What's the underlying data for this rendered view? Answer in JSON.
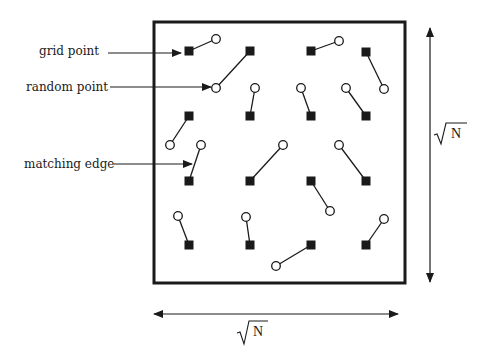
{
  "labels": {
    "grid_point": "grid point",
    "random_point": "random point",
    "matching_edge": "matching edge",
    "side_length_vertical": "N",
    "side_length_horizontal": "N"
  },
  "colors": {
    "ink": "#1a1a1a",
    "background": "#ffffff"
  },
  "box": {
    "x": 154,
    "y": 22,
    "width": 251,
    "height": 261
  },
  "grid_points": [
    [
      189,
      51
    ],
    [
      250,
      51
    ],
    [
      311,
      51
    ],
    [
      366,
      52
    ],
    [
      189,
      116
    ],
    [
      250,
      116
    ],
    [
      311,
      116
    ],
    [
      366,
      116
    ],
    [
      189,
      181
    ],
    [
      250,
      181
    ],
    [
      311,
      181
    ],
    [
      366,
      181
    ],
    [
      189,
      245
    ],
    [
      250,
      245
    ],
    [
      311,
      245
    ],
    [
      366,
      245
    ]
  ],
  "matching_edges": [
    {
      "grid": [
        189,
        51
      ],
      "random": [
        216,
        39
      ]
    },
    {
      "grid": [
        250,
        51
      ],
      "random": [
        216,
        88
      ]
    },
    {
      "grid": [
        311,
        51
      ],
      "random": [
        339,
        41
      ]
    },
    {
      "grid": [
        366,
        52
      ],
      "random": [
        384,
        89
      ]
    },
    {
      "grid": [
        189,
        116
      ],
      "random": [
        170,
        145
      ]
    },
    {
      "grid": [
        250,
        116
      ],
      "random": [
        255,
        88
      ]
    },
    {
      "grid": [
        311,
        116
      ],
      "random": [
        301,
        88
      ]
    },
    {
      "grid": [
        366,
        116
      ],
      "random": [
        346,
        88
      ]
    },
    {
      "grid": [
        189,
        181
      ],
      "random": [
        201,
        145
      ]
    },
    {
      "grid": [
        250,
        181
      ],
      "random": [
        283,
        145
      ]
    },
    {
      "grid": [
        311,
        181
      ],
      "random": [
        330,
        211
      ]
    },
    {
      "grid": [
        366,
        181
      ],
      "random": [
        339,
        145
      ]
    },
    {
      "grid": [
        189,
        245
      ],
      "random": [
        178,
        216
      ]
    },
    {
      "grid": [
        250,
        245
      ],
      "random": [
        246,
        217
      ]
    },
    {
      "grid": [
        311,
        245
      ],
      "random": [
        276,
        266
      ]
    },
    {
      "grid": [
        366,
        245
      ],
      "random": [
        384,
        219
      ]
    }
  ]
}
